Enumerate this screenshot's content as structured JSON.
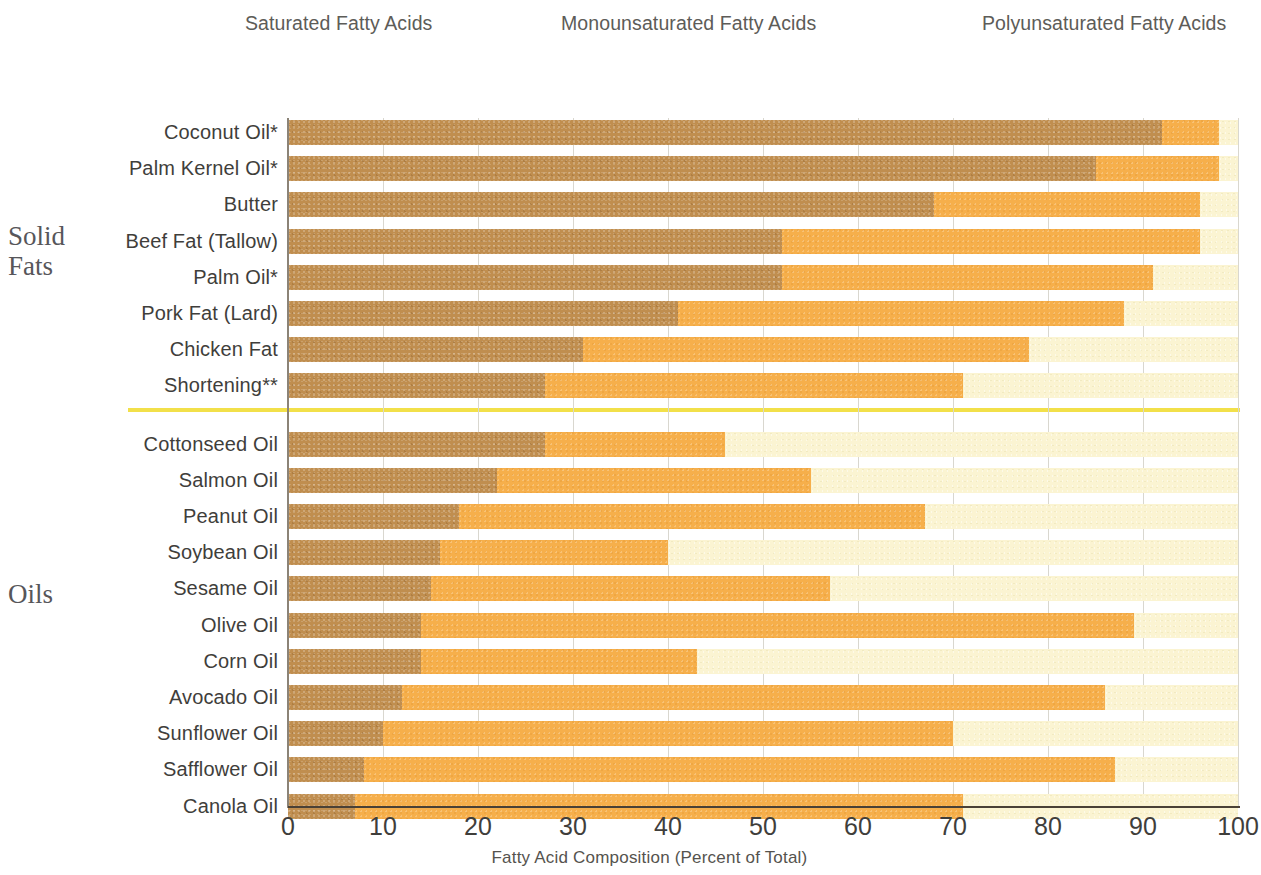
{
  "legend": {
    "items": [
      {
        "label": "Saturated Fatty Acids",
        "color": "#c08e4f",
        "key": "saturated"
      },
      {
        "label": "Monounsaturated Fatty Acids",
        "color": "#f6af4b",
        "key": "monounsaturated"
      },
      {
        "label": "Polyunsaturated Fatty Acids",
        "color": "#fbf4d2",
        "key": "polyunsaturated"
      }
    ]
  },
  "groups": [
    {
      "name": "solid-fats",
      "label": "Solid\nFats",
      "line1": "Solid",
      "line2": "Fats"
    },
    {
      "name": "oils",
      "label": "Oils",
      "line1": "Oils",
      "line2": ""
    }
  ],
  "axis": {
    "x_title": "Fatty Acid Composition (Percent of Total)",
    "ticks": [
      "0",
      "10",
      "20",
      "30",
      "40",
      "50",
      "60",
      "70",
      "80",
      "90",
      "100"
    ],
    "min": 0,
    "max": 100
  },
  "divider_color": "#f2e04a",
  "chart_data": {
    "type": "bar",
    "orientation": "horizontal",
    "stacked": true,
    "title": "",
    "xlabel": "Fatty Acid Composition (Percent of Total)",
    "ylabel": "",
    "xlim": [
      0,
      100
    ],
    "xticks": [
      0,
      10,
      20,
      30,
      40,
      50,
      60,
      70,
      80,
      90,
      100
    ],
    "grid": "vertical",
    "legend_position": "top",
    "categories": [
      "Coconut Oil*",
      "Palm Kernel Oil*",
      "Butter",
      "Beef Fat (Tallow)",
      "Palm Oil*",
      "Pork Fat (Lard)",
      "Chicken Fat",
      "Shortening**",
      "Cottonseed  Oil",
      "Salmon Oil",
      "Peanut Oil",
      "Soybean Oil",
      "Sesame Oil",
      "Olive Oil",
      "Corn Oil",
      "Avocado Oil",
      "Sunflower Oil",
      "Safflower Oil",
      "Canola Oil"
    ],
    "group_of_category": [
      "solid-fats",
      "solid-fats",
      "solid-fats",
      "solid-fats",
      "solid-fats",
      "solid-fats",
      "solid-fats",
      "solid-fats",
      "oils",
      "oils",
      "oils",
      "oils",
      "oils",
      "oils",
      "oils",
      "oils",
      "oils",
      "oils",
      "oils"
    ],
    "series": [
      {
        "name": "Saturated Fatty Acids",
        "color": "#c08e4f",
        "values": [
          92,
          85,
          68,
          52,
          52,
          41,
          31,
          27,
          27,
          22,
          18,
          16,
          15,
          14,
          14,
          12,
          10,
          8,
          7
        ]
      },
      {
        "name": "Monounsaturated Fatty Acids",
        "color": "#f6af4b",
        "values": [
          6,
          13,
          28,
          44,
          39,
          47,
          47,
          44,
          19,
          33,
          49,
          24,
          42,
          75,
          29,
          74,
          60,
          79,
          64
        ]
      },
      {
        "name": "Polyunsaturated Fatty Acids",
        "color": "#fbf4d2",
        "values": [
          2,
          2,
          4,
          4,
          9,
          12,
          22,
          29,
          54,
          45,
          33,
          60,
          43,
          11,
          57,
          14,
          30,
          13,
          29
        ]
      }
    ],
    "cumulative_breakpoints": {
      "Coconut Oil*": [
        92,
        98
      ],
      "Palm Kernel Oil*": [
        85,
        98
      ],
      "Butter": [
        68,
        96
      ],
      "Beef Fat (Tallow)": [
        52,
        96
      ],
      "Palm Oil*": [
        52,
        91
      ],
      "Pork Fat (Lard)": [
        41,
        88
      ],
      "Chicken Fat": [
        31,
        78
      ],
      "Shortening**": [
        27,
        71
      ],
      "Cottonseed  Oil": [
        27,
        46
      ],
      "Salmon Oil": [
        22,
        55
      ],
      "Peanut Oil": [
        18,
        67
      ],
      "Soybean Oil": [
        16,
        40
      ],
      "Sesame Oil": [
        15,
        57
      ],
      "Olive Oil": [
        14,
        89
      ],
      "Corn Oil": [
        14,
        43
      ],
      "Avocado Oil": [
        12,
        86
      ],
      "Sunflower Oil": [
        10,
        70
      ],
      "Safflower Oil": [
        8,
        87
      ],
      "Canola Oil": [
        7,
        71
      ]
    }
  }
}
